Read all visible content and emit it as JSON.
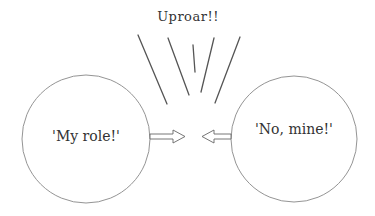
{
  "diagram": {
    "title": "Uproar!!",
    "left_circle": {
      "label": "'My role!'"
    },
    "right_circle": {
      "label": "'No, mine!'"
    },
    "colors": {
      "stroke": "#555555",
      "thin_stroke": "#888888",
      "text": "#333333",
      "background": "#ffffff"
    }
  }
}
